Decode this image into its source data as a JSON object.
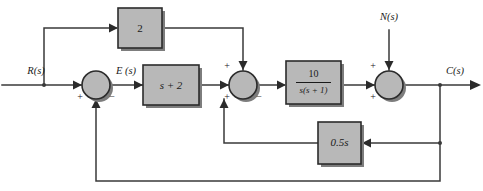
{
  "diagram": {
    "type": "control-system-block-diagram",
    "colors": {
      "block_fill": "#b8b8b8",
      "block_stroke": "#2b2b2b",
      "wire": "#3a3a3a",
      "background": "#ffffff",
      "shadow": "#7d7d7d"
    },
    "signals": {
      "reference_input": "R(s)",
      "error": "E (s)",
      "disturbance_input": "N(s)",
      "output": "C(s)"
    },
    "blocks": [
      {
        "id": "feedforward-gain",
        "label": "2",
        "description": "feedforward gain block"
      },
      {
        "id": "controller",
        "label": "s + 2",
        "description": "PD controller block"
      },
      {
        "id": "plant",
        "numerator": "10",
        "denominator": "s(s + 1)",
        "description": "plant transfer function block"
      },
      {
        "id": "rate-feedback-gain",
        "label": "0.5s",
        "description": "inner rate feedback block"
      }
    ],
    "summing_junctions": [
      {
        "id": "summer-1",
        "signs": {
          "left": "+",
          "bottom": "−"
        }
      },
      {
        "id": "summer-2",
        "signs": {
          "top": "+",
          "left": "+",
          "bottom": "−"
        }
      },
      {
        "id": "summer-3",
        "signs": {
          "top": "+",
          "left": "+"
        }
      }
    ]
  }
}
